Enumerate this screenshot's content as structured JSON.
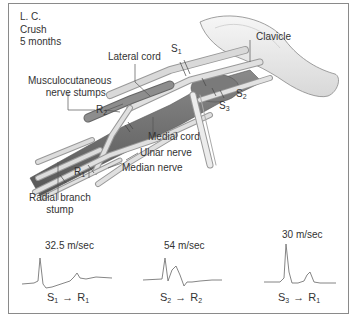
{
  "case_info": {
    "patient": "L. C.",
    "injury": "Crush",
    "duration": "5 months"
  },
  "anatomy_labels": {
    "clavicle": "Clavicle",
    "lateral_cord": "Lateral cord",
    "musculocutaneous": "Musculocutaneous nerve stumps",
    "musculocutaneous_line1": "Musculocutaneous",
    "musculocutaneous_line2": "nerve stumps",
    "medial_cord": "Medial cord",
    "ulnar_nerve": "Ulnar nerve",
    "median_nerve": "Median nerve",
    "radial_branch_line1": "Radial branch",
    "radial_branch_line2": "stump"
  },
  "points": {
    "S1": {
      "letter": "S",
      "sub": "1"
    },
    "S2": {
      "letter": "S",
      "sub": "2"
    },
    "S3": {
      "letter": "S",
      "sub": "3"
    },
    "R1": {
      "letter": "R",
      "sub": "1"
    },
    "R2": {
      "letter": "R",
      "sub": "2"
    }
  },
  "recordings": [
    {
      "velocity": "32.5 m/sec",
      "from": "S",
      "from_sub": "1",
      "to": "R",
      "to_sub": "1",
      "arrow": "→"
    },
    {
      "velocity": "54 m/sec",
      "from": "S",
      "from_sub": "2",
      "to": "R",
      "to_sub": "2",
      "arrow": "→"
    },
    {
      "velocity": "30 m/sec",
      "from": "S",
      "from_sub": "3",
      "to": "R",
      "to_sub": "1",
      "arrow": "→"
    }
  ],
  "colors": {
    "border": "#8a8a8a",
    "text": "#333333",
    "nerve_light": "#d4d4d4",
    "nerve_dark": "#6e6e6e",
    "bone": "#ececec"
  }
}
